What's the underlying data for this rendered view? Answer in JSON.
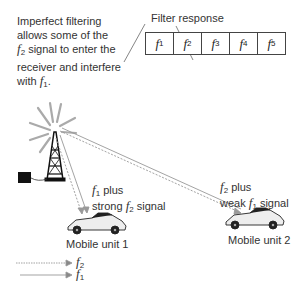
{
  "note": {
    "line1": "Imperfect filtering",
    "line2": "allows some of the",
    "line3_pre": "f",
    "line3_sub": "2",
    "line3_post": " signal to enter the",
    "line4": "receiver and interfere",
    "line5_pre": "with ",
    "line5_f": "f",
    "line5_sub": "1",
    "line5_post": "."
  },
  "filter": {
    "label": "Filter response",
    "channels": [
      {
        "f": "f",
        "sub": "1"
      },
      {
        "f": "f",
        "sub": "2"
      },
      {
        "f": "f",
        "sub": "3"
      },
      {
        "f": "f",
        "sub": "4"
      },
      {
        "f": "f",
        "sub": "5"
      }
    ]
  },
  "unit1": {
    "signal_f": "f",
    "signal_sub": "1",
    "signal_post": " plus",
    "line2_pre": "strong ",
    "line2_f": "f",
    "line2_sub": "2",
    "line2_post": " signal",
    "name": "Mobile unit 1"
  },
  "unit2": {
    "signal_f": "f",
    "signal_sub": "2",
    "signal_post": " plus",
    "line2_pre": "weak ",
    "line2_f": "f",
    "line2_sub": "1",
    "line2_post": " signal",
    "name": "Mobile unit 2"
  },
  "legend": [
    {
      "f": "f",
      "sub": "2",
      "style": "dotted"
    },
    {
      "f": "f",
      "sub": "1",
      "style": "dashed"
    }
  ],
  "colors": {
    "line": "#444444",
    "signal": "#999999",
    "tower": "#111111"
  }
}
